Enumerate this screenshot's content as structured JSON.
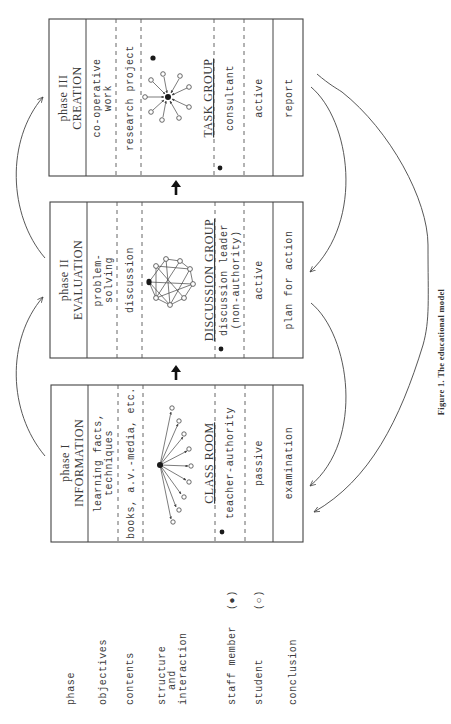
{
  "legend": {
    "rows": [
      {
        "key": "phase",
        "lines": [
          "phase"
        ]
      },
      {
        "key": "objectives",
        "lines": [
          "objectives"
        ]
      },
      {
        "key": "contents",
        "lines": [
          "contents"
        ]
      },
      {
        "key": "structure",
        "lines": [
          "structure",
          "and",
          "interaction"
        ]
      },
      {
        "key": "staff",
        "lines": [
          "staff member"
        ],
        "symbol": "(●)"
      },
      {
        "key": "student",
        "lines": [
          "student"
        ],
        "symbol": "(○)"
      },
      {
        "key": "conclusion",
        "lines": [
          "conclusion"
        ]
      }
    ]
  },
  "phases": [
    {
      "id": "phase1",
      "phase_label": "phase I",
      "title": "INFORMATION",
      "objectives": [
        "learning facts,",
        "techniques"
      ],
      "contents": "books, a.v.-media, etc.",
      "structure_name": "CLASS ROOM",
      "staff_role": [
        "teacher-authority"
      ],
      "student_role": "passive",
      "conclusion": "examination"
    },
    {
      "id": "phase2",
      "phase_label": "phase II",
      "title": "EVALUATION",
      "objectives": [
        "problem-",
        "solving"
      ],
      "contents": "discussion",
      "structure_name": "DISCUSSION GROUP",
      "staff_role": [
        "discussion leader",
        "(non-authority)"
      ],
      "student_role": "active",
      "conclusion": "plan for action"
    },
    {
      "id": "phase3",
      "phase_label": "phase III",
      "title": "CREATION",
      "objectives": [
        "co-operative",
        "work"
      ],
      "contents": "research project",
      "structure_name": "TASK GROUP",
      "staff_role": [
        "consultant"
      ],
      "student_role": "active",
      "conclusion": "report"
    }
  ],
  "caption": "Figure 1.  The educational model",
  "colors": {
    "ink": "#3a3a3a",
    "background": "#ffffff"
  }
}
